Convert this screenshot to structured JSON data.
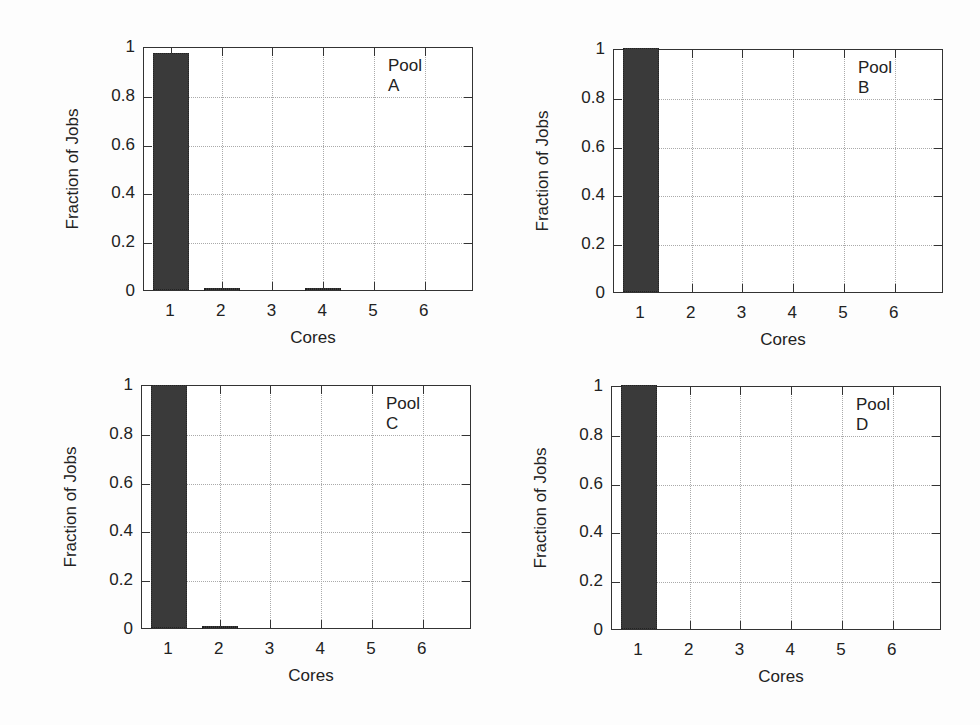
{
  "chart_data": [
    {
      "type": "bar",
      "title": "Pool A",
      "xlabel": "Cores",
      "ylabel": "Fraction of Jobs",
      "categories": [
        "1",
        "2",
        "3",
        "4",
        "5",
        "6"
      ],
      "values": [
        0.97,
        0.01,
        0.0,
        0.003,
        0.0,
        0.0
      ],
      "yticks": [
        "0",
        "0.2",
        "0.4",
        "0.6",
        "0.8",
        "1"
      ],
      "ylim": [
        0,
        1
      ],
      "grid": true,
      "legend_position": "top-right"
    },
    {
      "type": "bar",
      "title": "Pool B",
      "xlabel": "Cores",
      "ylabel": "Fraction of Jobs",
      "categories": [
        "1",
        "2",
        "3",
        "4",
        "5",
        "6"
      ],
      "values": [
        1.0,
        0.0,
        0.0,
        0.0,
        0.0,
        0.0
      ],
      "yticks": [
        "0",
        "0.2",
        "0.4",
        "0.6",
        "0.8",
        "1"
      ],
      "ylim": [
        0,
        1
      ],
      "grid": true,
      "legend_position": "top-right"
    },
    {
      "type": "bar",
      "title": "Pool C",
      "xlabel": "Cores",
      "ylabel": "Fraction of Jobs",
      "categories": [
        "1",
        "2",
        "3",
        "4",
        "5",
        "6"
      ],
      "values": [
        0.995,
        0.005,
        0.0,
        0.0,
        0.0,
        0.0
      ],
      "yticks": [
        "0",
        "0.2",
        "0.4",
        "0.6",
        "0.8",
        "1"
      ],
      "ylim": [
        0,
        1
      ],
      "grid": true,
      "legend_position": "top-right"
    },
    {
      "type": "bar",
      "title": "Pool D",
      "xlabel": "Cores",
      "ylabel": "Fraction of Jobs",
      "categories": [
        "1",
        "2",
        "3",
        "4",
        "5",
        "6"
      ],
      "values": [
        1.0,
        0.0,
        0.0,
        0.0,
        0.0,
        0.0
      ],
      "yticks": [
        "0",
        "0.2",
        "0.4",
        "0.6",
        "0.8",
        "1"
      ],
      "ylim": [
        0,
        1
      ],
      "grid": true,
      "legend_position": "top-right"
    }
  ],
  "colors": {
    "bar": "#3a3a3a",
    "frame": "#333333",
    "grid": "#aaaaaa"
  }
}
